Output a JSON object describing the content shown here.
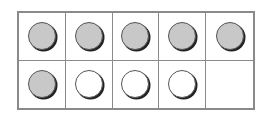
{
  "ten_frame": {
    "rows": 2,
    "columns": 5,
    "cells": [
      {
        "counter": "filled"
      },
      {
        "counter": "filled"
      },
      {
        "counter": "filled"
      },
      {
        "counter": "filled"
      },
      {
        "counter": "filled"
      },
      {
        "counter": "filled"
      },
      {
        "counter": "empty"
      },
      {
        "counter": "empty"
      },
      {
        "counter": "empty"
      },
      {
        "counter": "none"
      }
    ],
    "filled_count": 6,
    "empty_count": 3,
    "blank_cells": 1,
    "colors": {
      "filled": "#c8c8c8",
      "empty": "#ffffff",
      "grid_line": "#8a8a8a",
      "counter_outline": "#555555"
    }
  }
}
